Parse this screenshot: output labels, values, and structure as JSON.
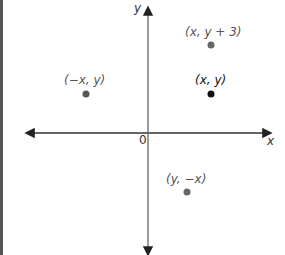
{
  "axes": {
    "x_label": "x",
    "y_label": "y",
    "origin_label": "0"
  },
  "points": [
    {
      "label": "(x, y + 3)",
      "role": "translated"
    },
    {
      "label": "(x, y)",
      "role": "original"
    },
    {
      "label": "(−x, y)",
      "role": "reflected"
    },
    {
      "label": "(y, −x)",
      "role": "rotated"
    }
  ],
  "colors": {
    "axis": "#555555",
    "original_point": "#111111",
    "other_point": "#666666",
    "left_bar": "#555555"
  }
}
